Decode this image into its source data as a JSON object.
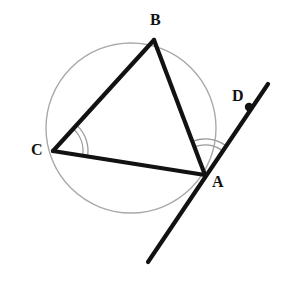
{
  "figure": {
    "width": 281,
    "height": 294,
    "background_color": "#ffffff"
  },
  "labels": {
    "a": "A",
    "b": "B",
    "c": "C",
    "d": "D"
  },
  "colors": {
    "stroke_dark": "#121212",
    "circle_gray": "#a9a9a9",
    "arc_gray": "#9a9a9a",
    "point_fill": "#121212"
  },
  "geometry": {
    "circle": {
      "name": "circumcircle",
      "cx": 131,
      "cy": 128,
      "r": 85,
      "stroke_width": 1.4
    },
    "points": [
      {
        "id": "A",
        "x": 205,
        "y": 175,
        "label": "A",
        "label_x": 212,
        "label_y": 174,
        "marked_dot": false
      },
      {
        "id": "B",
        "x": 154,
        "y": 40,
        "label": "B",
        "label_x": 150,
        "label_y": 12,
        "marked_dot": false
      },
      {
        "id": "C",
        "x": 53,
        "y": 151,
        "label": "C",
        "label_x": 31,
        "label_y": 142,
        "marked_dot": false
      },
      {
        "id": "D",
        "x": 249,
        "y": 107,
        "label": "D",
        "label_x": 232,
        "label_y": 88,
        "marked_dot": true
      }
    ],
    "segments": [
      {
        "id": "CB",
        "from": "C",
        "to": "B",
        "x1": 53,
        "y1": 151,
        "x2": 154,
        "y2": 40,
        "stroke_width": 4.2
      },
      {
        "id": "BA",
        "from": "B",
        "to": "A",
        "x1": 154,
        "y1": 40,
        "x2": 205,
        "y2": 175,
        "stroke_width": 4.2
      },
      {
        "id": "CA",
        "from": "C",
        "to": "A",
        "x1": 53,
        "y1": 151,
        "x2": 205,
        "y2": 175,
        "stroke_width": 4.2
      }
    ],
    "tangent_line": {
      "id": "tangent-at-A",
      "through": "A",
      "x1": 268,
      "y1": 84,
      "x2": 148,
      "y2": 262,
      "stroke_width": 4.2
    },
    "point_dot": {
      "id": "point-D-dot",
      "cx": 249,
      "cy": 107,
      "r": 4.2
    },
    "angle_marks": [
      {
        "id": "angle-BCA",
        "vertex": "C",
        "arc_count": 2,
        "radii": [
          30,
          35
        ],
        "start_deg": -47.7,
        "end_deg": 9.0
      },
      {
        "id": "angle-BAD",
        "vertex": "A",
        "arc_count": 2,
        "radii": [
          30,
          36
        ],
        "start_deg": -110.7,
        "end_deg": -56.0
      }
    ]
  }
}
